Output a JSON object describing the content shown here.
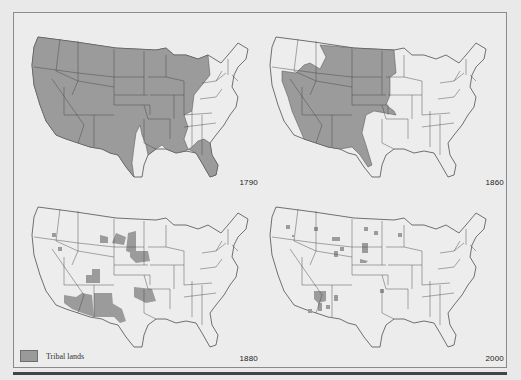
{
  "figure": {
    "legend": {
      "label": "Tribal lands",
      "swatch_color": "#9b9b9b"
    },
    "land_color": "#ededed",
    "border_color": "#3a3a3a",
    "panels": [
      {
        "year": "1790",
        "position": "top-left",
        "description": "Tribal lands cover nearly all states west of the Appalachians except parts of Texas, Louisiana, Kentucky and Tennessee"
      },
      {
        "year": "1860",
        "position": "top-right",
        "description": "Tribal lands cover the Great Plains, Great Basin and Southwest (Montana, Dakotas, Wyoming, Nevada, Utah, Colorado, Arizona, New Mexico, west Texas, Oklahoma)"
      },
      {
        "year": "1880",
        "position": "bottom-left",
        "description": "Tribal lands reduced to reservations: Arizona, New Mexico, Oklahoma, Dakotas, Montana and scattered smaller areas"
      },
      {
        "year": "2000",
        "position": "bottom-right",
        "description": "Tribal lands are small scattered reservations, largest in northeastern Arizona"
      }
    ]
  }
}
